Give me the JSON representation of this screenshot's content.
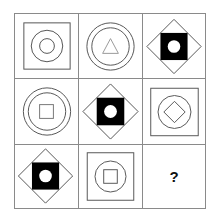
{
  "puzzle": {
    "type": "3x3 figure matrix",
    "cells": [
      {
        "row": 1,
        "col": 1,
        "outer": "square",
        "middle": "circle",
        "inner": "circle"
      },
      {
        "row": 1,
        "col": 2,
        "outer": "circle",
        "middle": "circle",
        "inner": "triangle"
      },
      {
        "row": 1,
        "col": 3,
        "outer": "diamond",
        "middle": "filled-square",
        "inner": "white-circle"
      },
      {
        "row": 2,
        "col": 1,
        "outer": "circle",
        "middle": "circle",
        "inner": "square"
      },
      {
        "row": 2,
        "col": 2,
        "outer": "diamond",
        "middle": "filled-square",
        "inner": "white-circle"
      },
      {
        "row": 2,
        "col": 3,
        "outer": "square",
        "middle": "circle",
        "inner": "diamond"
      },
      {
        "row": 3,
        "col": 1,
        "outer": "diamond",
        "middle": "filled-square",
        "inner": "white-circle"
      },
      {
        "row": 3,
        "col": 2,
        "outer": "square",
        "middle": "circle",
        "inner": "square"
      },
      {
        "row": 3,
        "col": 3,
        "answer": "?"
      }
    ],
    "question_mark": "?"
  },
  "colors": {
    "line": "#555555",
    "fill": "#000000",
    "grid": "#8a8a8a"
  }
}
